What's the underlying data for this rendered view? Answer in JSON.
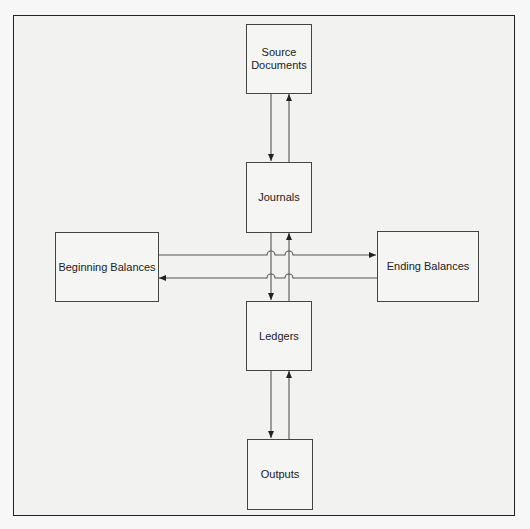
{
  "diagram": {
    "type": "flow",
    "nodes": {
      "source_documents": {
        "label": "Source\nDocuments"
      },
      "journals": {
        "label": "Journals"
      },
      "beginning_balances": {
        "label": "Beginning Balances"
      },
      "ending_balances": {
        "label": "Ending Balances"
      },
      "ledgers": {
        "label": "Ledgers"
      },
      "outputs": {
        "label": "Outputs"
      }
    },
    "edges": [
      {
        "from": "Source Documents",
        "to": "Journals"
      },
      {
        "from": "Journals",
        "to": "Source Documents"
      },
      {
        "from": "Journals",
        "to": "Ledgers"
      },
      {
        "from": "Ledgers",
        "to": "Journals"
      },
      {
        "from": "Beginning Balances",
        "to": "Ending Balances"
      },
      {
        "from": "Ending Balances",
        "to": "Beginning Balances"
      },
      {
        "from": "Ledgers",
        "to": "Outputs"
      },
      {
        "from": "Outputs",
        "to": "Ledgers"
      }
    ],
    "colors": {
      "line": "#444444",
      "frame": "#222222",
      "background": "#f2f2f1"
    }
  }
}
